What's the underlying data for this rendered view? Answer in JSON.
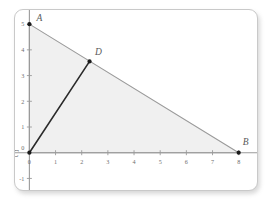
{
  "figure": {
    "title": "",
    "background_color": "#ffffff",
    "card_border_color": "#c9c9c9"
  },
  "chart_data": {
    "type": "scatter",
    "title": "",
    "xlabel": "",
    "ylabel": "",
    "xlim": [
      -0.55,
      8.7
    ],
    "ylim": [
      -1.45,
      5.55
    ],
    "grid": false,
    "legend": null,
    "x_ticks": [
      0,
      1,
      2,
      3,
      4,
      5,
      6,
      7,
      8
    ],
    "x_tick_labels": [
      "0",
      "1",
      "2",
      "3",
      "4",
      "5",
      "6",
      "7",
      "8"
    ],
    "y_ticks": [
      -1,
      0,
      1,
      2,
      3,
      4,
      5
    ],
    "y_tick_labels": [
      "-1",
      "0",
      "1",
      "2",
      "3",
      "4",
      "5"
    ],
    "points": [
      {
        "name": "A",
        "label": "A",
        "x": 0,
        "y": 5,
        "label_dx": 10,
        "label_dy": -3
      },
      {
        "name": "D",
        "label": "D",
        "x": 2.3,
        "y": 3.55,
        "label_dx": 9,
        "label_dy": -6
      },
      {
        "name": "B",
        "label": "B",
        "x": 8,
        "y": 0,
        "label_dx": 7,
        "label_dy": -8
      },
      {
        "name": "C",
        "label": "C",
        "x": 0,
        "y": 0,
        "label_dx": -14,
        "label_dy": 4
      }
    ],
    "segments": [
      {
        "name": "segment-AB",
        "from": "A",
        "to": "B",
        "color": "#9a9a9a",
        "width": 1.1
      },
      {
        "name": "segment-CA",
        "from": "C",
        "to": "A",
        "color": "#9a9a9a",
        "width": 1.1
      },
      {
        "name": "segment-CB",
        "from": "C",
        "to": "B",
        "color": "#9a9a9a",
        "width": 1.1
      },
      {
        "name": "segment-CD",
        "from": "C",
        "to": "D",
        "color": "#2b2b2b",
        "width": 1.6
      }
    ],
    "shaded_region": {
      "name": "triangle-ACB",
      "vertices": [
        "C",
        "A",
        "B"
      ],
      "fill": "#f0f0f0"
    },
    "axis_color": "#9a9a9a",
    "point_color": "#1a1a1a"
  },
  "labels": {
    "A": "A",
    "B": "B",
    "C": "C",
    "D": "D",
    "x0": "0",
    "y0": "0",
    "x1": "1",
    "x2": "2",
    "x3": "3",
    "x4": "4",
    "x5": "5",
    "x6": "6",
    "x7": "7",
    "x8": "8",
    "y1": "1",
    "y2": "2",
    "y3": "3",
    "y4": "4",
    "y5": "5",
    "ym1": "-1"
  }
}
